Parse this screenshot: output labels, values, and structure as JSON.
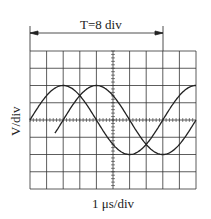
{
  "period_label": "T=8 div",
  "y_axis_label": "V/div",
  "x_axis_label": "1 μs/div",
  "grid": {
    "h_divisions": 10,
    "v_divisions": 8
  },
  "waves": [
    {
      "name": "wave-1",
      "amplitude_div": 2,
      "period_div": 8,
      "phase_start_div": 0
    },
    {
      "name": "wave-2",
      "amplitude_div": 2,
      "period_div": 8,
      "phase_start_div": 2
    }
  ],
  "colors": {
    "line": "#222222"
  }
}
